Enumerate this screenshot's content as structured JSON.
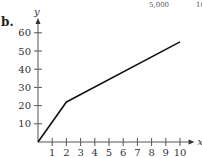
{
  "header": {
    "cut_text_1": "5,000",
    "cut_text_2": "10"
  },
  "part_label": "b.",
  "chart_data": {
    "type": "line",
    "title": "",
    "xlabel": "x",
    "ylabel": "y",
    "x": [
      0,
      2,
      10
    ],
    "series": [
      {
        "name": "y",
        "values": [
          0,
          22,
          55
        ]
      }
    ],
    "xticks": [
      1,
      2,
      3,
      4,
      5,
      6,
      7,
      8,
      9,
      10
    ],
    "yticks": [
      10,
      20,
      30,
      40,
      50,
      60
    ],
    "xlim": [
      0,
      10.5
    ],
    "ylim": [
      0,
      65
    ],
    "grid": false,
    "legend": null
  }
}
